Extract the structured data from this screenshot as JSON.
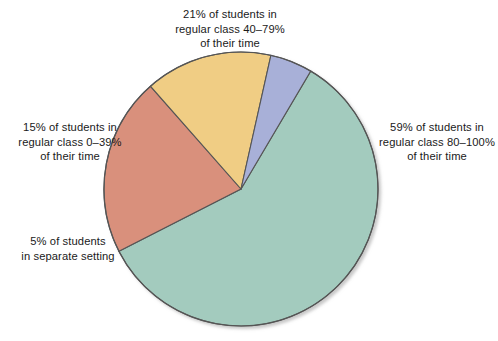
{
  "chart_data": {
    "type": "pie",
    "title": "",
    "categories": [
      "59% of students in regular class 80–100% of their time",
      "21% of students in regular class 40–79% of their time",
      "15% of students in regular class 0–39% of their time",
      "5% of students in separate setting"
    ],
    "values": [
      59,
      21,
      15,
      5
    ],
    "units": "percent",
    "colors": [
      "#a3cbbe",
      "#d9907c",
      "#f0cd84",
      "#a8b0d8"
    ],
    "legend": "none",
    "labels_position": "outside-callout-free",
    "slices": [
      {
        "name": "regular-class-80-100",
        "value": 59,
        "label": "59% of students in\nregular class 80–100%\nof their time",
        "color": "#a3cbbe",
        "start_angle_deg": 30.6,
        "sweep_deg": 212.4
      },
      {
        "name": "regular-class-40-79",
        "value": 21,
        "label": "21% of students in\nregular class 40–79%\nof their time",
        "color": "#d9907c",
        "start_angle_deg": 243.0,
        "sweep_deg": 75.6
      },
      {
        "name": "regular-class-0-39",
        "value": 15,
        "label": "15% of students in\nregular class 0–39%\nof their time",
        "color": "#f0cd84",
        "start_angle_deg": 318.6,
        "sweep_deg": 54.0
      },
      {
        "name": "separate-setting",
        "value": 5,
        "label": "5% of students\nin separate setting",
        "color": "#a8b0d8",
        "start_angle_deg": 12.6,
        "sweep_deg": 18.0
      }
    ],
    "geometry": {
      "center_x": 241,
      "center_y": 189,
      "radius": 137
    },
    "stroke_color": "#555555",
    "background_color": "#ffffff"
  },
  "labels": {
    "top": "21% of students in\nregular class 40–79%\nof their time",
    "left_upper": "15% of students in\nregular class 0–39%\nof their time",
    "left_lower": "5% of students\nin separate setting",
    "right": "59% of students in\nregular class 80–100%\nof their time"
  }
}
